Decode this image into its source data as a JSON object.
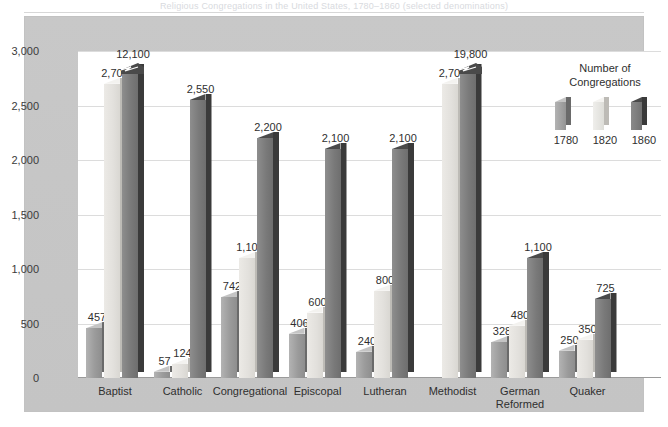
{
  "caption": {
    "text": "Religious Congregations in the United States, 1780–1860 (selected denominations)"
  },
  "chart_data": {
    "type": "bar",
    "title": "",
    "xlabel": "",
    "ylabel": "",
    "ylim": [
      0,
      3000
    ],
    "yticks": [
      "0",
      "500",
      "1,000",
      "1,500",
      "2,000",
      "2,500",
      "3,000"
    ],
    "ytick_values": [
      0,
      500,
      1000,
      1500,
      2000,
      2500,
      3000
    ],
    "grid": true,
    "legend_position": "inside-top-right",
    "legend_title_line1": "Number of",
    "legend_title_line2": "Congregations",
    "categories": [
      "Baptist",
      "Catholic",
      "Congregational",
      "Episcopal",
      "Lutheran",
      "Methodist",
      "German Reformed",
      "Quaker"
    ],
    "series": [
      {
        "name": "1780",
        "color": "#9b9b9b",
        "values": [
          457,
          57,
          742,
          406,
          240,
          null,
          328,
          250
        ],
        "labels": [
          "457",
          "57",
          "742",
          "406",
          "240",
          "",
          "328",
          "250"
        ]
      },
      {
        "name": "1820",
        "color": "#e2e0dc",
        "values": [
          2700,
          124,
          1100,
          600,
          800,
          2700,
          480,
          350
        ],
        "labels": [
          "2,700",
          "124",
          "1,100",
          "600",
          "800",
          "2,700",
          "480",
          "350"
        ]
      },
      {
        "name": "1860",
        "color": "#7a7a7a",
        "values": [
          12100,
          2550,
          2200,
          2100,
          2100,
          19800,
          1100,
          725
        ],
        "labels": [
          "12,100",
          "2,550",
          "2,200",
          "2,100",
          "2,100",
          "19,800",
          "1,100",
          "725"
        ],
        "truncated_bars": [
          "Baptist",
          "Methodist"
        ]
      }
    ]
  }
}
